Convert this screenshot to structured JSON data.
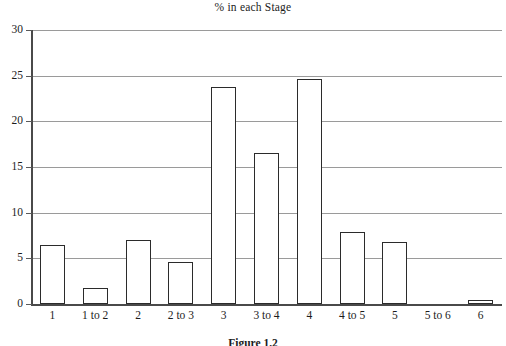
{
  "chart_data": {
    "type": "bar",
    "title": "% in each Stage",
    "xlabel": "",
    "ylabel": "",
    "ylim": [
      0,
      30
    ],
    "yticks": [
      0,
      5,
      10,
      15,
      20,
      25,
      30
    ],
    "grid": true,
    "legend": false,
    "categories": [
      "1",
      "1 to 2",
      "2",
      "2 to 3",
      "3",
      "3 to 4",
      "4",
      "4 to 5",
      "5",
      "5 to 6",
      "6"
    ],
    "values": [
      6.5,
      1.8,
      7.0,
      4.6,
      23.8,
      16.5,
      24.6,
      7.9,
      6.8,
      0.0,
      0.4
    ],
    "bar_style": {
      "fill": "#ffffff",
      "edge": "#2b2b2b",
      "edge_width": 1.6
    },
    "axis_color": "#4a4a4a",
    "gridline_color": "#9a9a9a",
    "text_color": "#1c1c1c"
  },
  "caption": {
    "text": "Figure 1.2"
  }
}
